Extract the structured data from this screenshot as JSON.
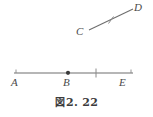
{
  "figure": {
    "caption_prefix": "図",
    "caption_number": "2. 22",
    "caption_full": "図 2. 22",
    "stroke_color": "#6e6e6e",
    "label_color": "#4a4a4a",
    "background_color": "#ffffff"
  },
  "labels": {
    "A": "A",
    "B": "B",
    "C": "C",
    "D": "D",
    "E": "E"
  },
  "geometry": {
    "segments": [
      {
        "name": "line-AE",
        "from": "A",
        "to": "E",
        "x1": 14,
        "y1": 73,
        "x2": 133,
        "y2": 73
      },
      {
        "name": "segment-CD",
        "from": "C",
        "to": "D",
        "x1": 89,
        "y1": 30,
        "x2": 133,
        "y2": 9
      }
    ],
    "points": [
      {
        "name": "point-B",
        "label": "B",
        "x": 68,
        "y": 73,
        "style": "filled-dot"
      }
    ],
    "tick_marks": [
      {
        "name": "tick-on-AE",
        "x": 96,
        "y": 73,
        "orientation": "vertical"
      },
      {
        "name": "tick-end-A",
        "x": 16,
        "y": 71,
        "orientation": "vertical-short"
      },
      {
        "name": "tick-end-E",
        "x": 131,
        "y": 71,
        "orientation": "vertical-short"
      },
      {
        "name": "tick-on-CD",
        "x": 111,
        "y": 19.5,
        "orientation": "perpendicular"
      }
    ],
    "label_positions": [
      {
        "label": "A",
        "x": 12,
        "y": 79
      },
      {
        "label": "B",
        "x": 64,
        "y": 79
      },
      {
        "label": "E",
        "x": 120,
        "y": 79
      },
      {
        "label": "C",
        "x": 77,
        "y": 27
      },
      {
        "label": "D",
        "x": 135,
        "y": 2
      }
    ]
  }
}
